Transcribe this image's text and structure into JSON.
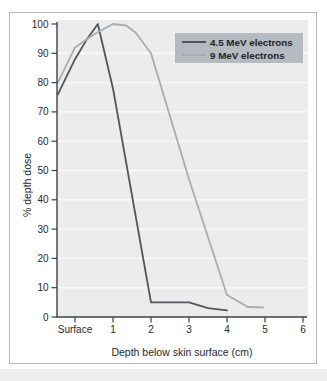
{
  "figure": {
    "type": "textbook-figure",
    "description_note": "Electron beam percentage depth dose curves"
  },
  "colors": {
    "page_background": "#ffffff",
    "page_bottom_strip": "#ededee",
    "frame_border": "#b3b7bb",
    "plot_background": "#ececed",
    "gridline": "#ffffff",
    "axis": "#3c4147",
    "text": "#26292d",
    "legend_background": "#b4bac0",
    "series_dark": "#4f565e",
    "series_light": "#a7adb3"
  },
  "chart_data": {
    "type": "line",
    "title": "",
    "xlabel": "Depth below skin surface (cm)",
    "ylabel": "% depth dose",
    "x_tick_labels": [
      "Surface",
      "1",
      "2",
      "3",
      "4",
      "5",
      "6"
    ],
    "x_tick_positions_cm": [
      0,
      1,
      2,
      3,
      4,
      5,
      6
    ],
    "y_ticks": [
      0,
      10,
      20,
      30,
      40,
      50,
      60,
      70,
      80,
      90,
      100
    ],
    "ylim": [
      0,
      100
    ],
    "grid": "faint white horizontal lines at every 10% inside shaded plot area",
    "legend_position": "top-right",
    "x_note": "curves begin at the y-axis, slightly left of the Surface tick (depth -0.45 in tick units)",
    "series": [
      {
        "name": "4.5 MeV electrons",
        "color": "#4f565e",
        "points": [
          [
            -0.45,
            76
          ],
          [
            0,
            88
          ],
          [
            0.3,
            94.5
          ],
          [
            0.6,
            100
          ],
          [
            1,
            78
          ],
          [
            2,
            5
          ],
          [
            3,
            5
          ],
          [
            3.5,
            3
          ],
          [
            4,
            2.3
          ]
        ]
      },
      {
        "name": "9 MeV electrons",
        "color": "#a7adb3",
        "points": [
          [
            -0.45,
            80
          ],
          [
            0,
            92
          ],
          [
            0.5,
            96.5
          ],
          [
            1,
            100
          ],
          [
            1.35,
            99.5
          ],
          [
            1.6,
            97
          ],
          [
            2,
            90
          ],
          [
            3,
            47
          ],
          [
            4,
            7.5
          ],
          [
            4.55,
            3.4
          ],
          [
            4.95,
            3.3
          ]
        ]
      }
    ]
  }
}
